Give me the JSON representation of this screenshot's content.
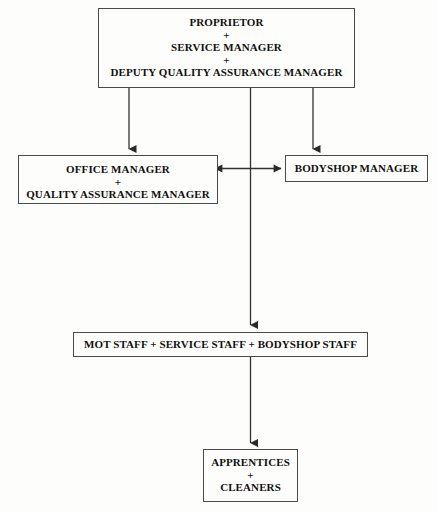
{
  "diagram": {
    "type": "org-chart",
    "background_color": "#fdfdfc",
    "line_color": "#333333",
    "text_color": "#111111",
    "separator": "+",
    "nodes": [
      {
        "id": "top",
        "name": "proprietor-node",
        "level": 1,
        "roles": [
          "PROPRIETOR",
          "SERVICE MANAGER",
          "DEPUTY QUALITY ASSURANCE MANAGER"
        ]
      },
      {
        "id": "office",
        "name": "office-manager-node",
        "level": 2,
        "roles": [
          "OFFICE MANAGER",
          "QUALITY ASSURANCE MANAGER"
        ]
      },
      {
        "id": "bodyshop",
        "name": "bodyshop-manager-node",
        "level": 2,
        "roles": [
          "BODYSHOP MANAGER"
        ]
      },
      {
        "id": "staff",
        "name": "staff-node",
        "level": 3,
        "roles": [
          "MOT STAFF + SERVICE STAFF + BODYSHOP STAFF"
        ]
      },
      {
        "id": "apprentices",
        "name": "apprentices-node",
        "level": 4,
        "roles": [
          "APPRENTICES",
          "CLEANERS"
        ]
      }
    ],
    "edges": [
      {
        "from": "top",
        "to": "office",
        "style": "arrow-down"
      },
      {
        "from": "top",
        "to": "bodyshop",
        "style": "arrow-down"
      },
      {
        "from": "top",
        "to": "staff",
        "style": "arrow-down"
      },
      {
        "from": "office",
        "to": "bodyshop",
        "style": "double-arrow-horizontal"
      },
      {
        "from": "staff",
        "to": "apprentices",
        "style": "arrow-down"
      }
    ]
  }
}
